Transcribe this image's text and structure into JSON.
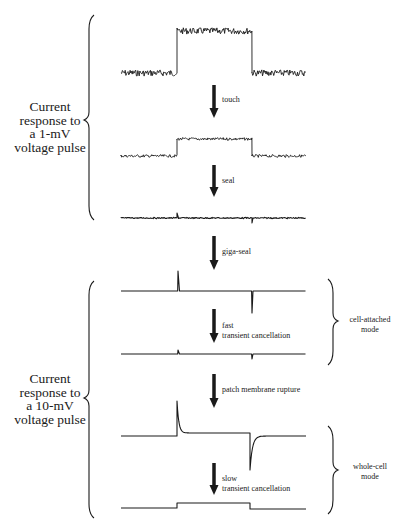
{
  "figure": {
    "left_groups": [
      {
        "id": "group-1mv",
        "lines": [
          "Current",
          "response to",
          "a 1-mV",
          "voltage pulse"
        ],
        "brace": {
          "x": 83,
          "y1": 15,
          "y2": 220,
          "tip": 120
        },
        "label_top": 100
      },
      {
        "id": "group-10mv",
        "lines": [
          "Current",
          "response to",
          "a 10-mV",
          "voltage pulse"
        ],
        "brace": {
          "x": 83,
          "y1": 281,
          "y2": 518,
          "tip": 398
        },
        "label_top": 372
      }
    ],
    "right_groups": [
      {
        "id": "cell-attached",
        "lines": [
          "cell-attached",
          "mode"
        ],
        "brace": {
          "x": 333,
          "y1": 279,
          "y2": 365,
          "tip": 321
        },
        "label_top": 315
      },
      {
        "id": "whole-cell",
        "lines": [
          "whole-cell",
          "mode"
        ],
        "brace": {
          "x": 333,
          "y1": 426,
          "y2": 514,
          "tip": 470
        },
        "label_top": 462
      }
    ],
    "steps": [
      {
        "id": "touch",
        "lines": [
          "touch"
        ],
        "arrow": {
          "x": 214,
          "y1": 85,
          "y2": 118
        },
        "label_top": 95
      },
      {
        "id": "seal",
        "lines": [
          "seal"
        ],
        "arrow": {
          "x": 214,
          "y1": 165,
          "y2": 197
        },
        "label_top": 176
      },
      {
        "id": "giga-seal",
        "lines": [
          "giga-seal"
        ],
        "arrow": {
          "x": 214,
          "y1": 236,
          "y2": 270
        },
        "label_top": 247
      },
      {
        "id": "fast-transient-cancellation",
        "lines": [
          "fast",
          "transient cancellation"
        ],
        "arrow": {
          "x": 214,
          "y1": 309,
          "y2": 343
        },
        "label_top": 321
      },
      {
        "id": "patch-membrane-rupture",
        "lines": [
          "patch membrane rupture"
        ],
        "arrow": {
          "x": 214,
          "y1": 374,
          "y2": 408
        },
        "label_top": 385
      },
      {
        "id": "slow-transient-cancellation",
        "lines": [
          "slow",
          "transient cancellation"
        ],
        "arrow": {
          "x": 214,
          "y1": 463,
          "y2": 495
        },
        "label_top": 474
      }
    ],
    "traces": [
      {
        "id": "trace-1-open-pipette",
        "type": "noisy-step",
        "x0": 121,
        "x_on": 177,
        "x_off": 252,
        "x1": 306,
        "base": 73,
        "high": 31,
        "noise": 3.2
      },
      {
        "id": "trace-2-touch",
        "type": "noisy-step",
        "x0": 121,
        "x_on": 177,
        "x_off": 252,
        "x1": 306,
        "base": 156,
        "high": 139,
        "noise": 1.4
      },
      {
        "id": "trace-3-seal",
        "type": "spikes",
        "x0": 121,
        "x_on": 177,
        "x_off": 252,
        "x1": 306,
        "base": 218,
        "up": 5,
        "down": 5,
        "noise": 0.6
      },
      {
        "id": "trace-4-giga-seal",
        "type": "spikes",
        "x0": 121,
        "x_on": 178,
        "x_off": 252,
        "x1": 306,
        "base": 291,
        "up": 20,
        "down": 22,
        "noise": 0
      },
      {
        "id": "trace-5-fast-cancel",
        "type": "spikes",
        "x0": 121,
        "x_on": 178,
        "x_off": 252,
        "x1": 306,
        "base": 354,
        "up": 4,
        "down": 5,
        "noise": 0
      },
      {
        "id": "trace-6-whole-cell",
        "type": "capacitive",
        "x0": 121,
        "x_on": 177,
        "x_off": 250,
        "x1": 306,
        "base": 436,
        "plateau": 433,
        "peak": 401,
        "trough": 470
      },
      {
        "id": "trace-7-slow-cancel",
        "type": "small-step",
        "x0": 121,
        "x_on": 177,
        "x_off": 250,
        "x1": 306,
        "base": 508,
        "high": 503,
        "after": 509
      }
    ],
    "colors": {
      "ink": "#1a1a1a",
      "background": "#ffffff"
    }
  }
}
